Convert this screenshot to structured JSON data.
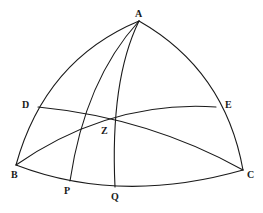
{
  "figure": {
    "type": "spherical-triangle-diagram",
    "points": {
      "A": {
        "label": "A",
        "x": 139,
        "y": 21
      },
      "B": {
        "label": "B",
        "x": 16,
        "y": 165
      },
      "C": {
        "label": "C",
        "x": 243,
        "y": 170
      },
      "D": {
        "label": "D",
        "x": 38,
        "y": 107
      },
      "E": {
        "label": "E",
        "x": 216,
        "y": 107
      },
      "Z": {
        "label": "Z",
        "x": 112,
        "y": 121
      },
      "P": {
        "label": "P",
        "x": 70,
        "y": 181
      },
      "Q": {
        "label": "Q",
        "x": 115,
        "y": 187
      }
    },
    "arcs": [
      "AB",
      "AC",
      "BC",
      "AP",
      "AQ",
      "DC",
      "BE"
    ],
    "stroke_color": "#1a1a1a"
  }
}
